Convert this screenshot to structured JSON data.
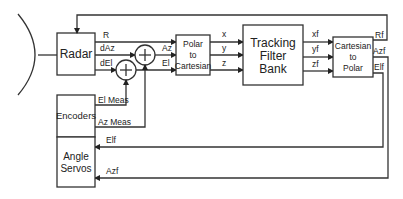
{
  "diagram": {
    "type": "block-diagram",
    "title": "",
    "blocks": {
      "radar": {
        "label": "Radar"
      },
      "polar_to_cartesian": {
        "line1": "Polar",
        "line2": "to",
        "line3": "Cartesian"
      },
      "tracking_filter_bank": {
        "line1": "Tracking",
        "line2": "Filter",
        "line3": "Bank"
      },
      "cartesian_to_polar": {
        "line1": "Cartesian",
        "line2": "to",
        "line3": "Polar"
      },
      "encoders": {
        "label": "Encoders"
      },
      "angle_servos": {
        "line1": "Angle",
        "line2": "Servos"
      }
    },
    "signals": {
      "r": "R",
      "daz": "dAz",
      "del": "dEl",
      "az": "Az",
      "el": "El",
      "x": "x",
      "y": "y",
      "z": "z",
      "xf": "xf",
      "yf": "yf",
      "zf": "zf",
      "rf": "Rf",
      "azf": "Azf",
      "elf": "Elf",
      "el_meas": "El Meas",
      "az_meas": "Az Meas",
      "elf_servo": "Elf",
      "azf_servo": "Azf"
    },
    "summing_junctions": [
      {
        "id": "az-sum",
        "symbol": "+"
      },
      {
        "id": "el-sum",
        "symbol": "+"
      }
    ],
    "colors": {
      "stroke": "#333333",
      "background": "#ffffff",
      "text": "#222222"
    }
  }
}
